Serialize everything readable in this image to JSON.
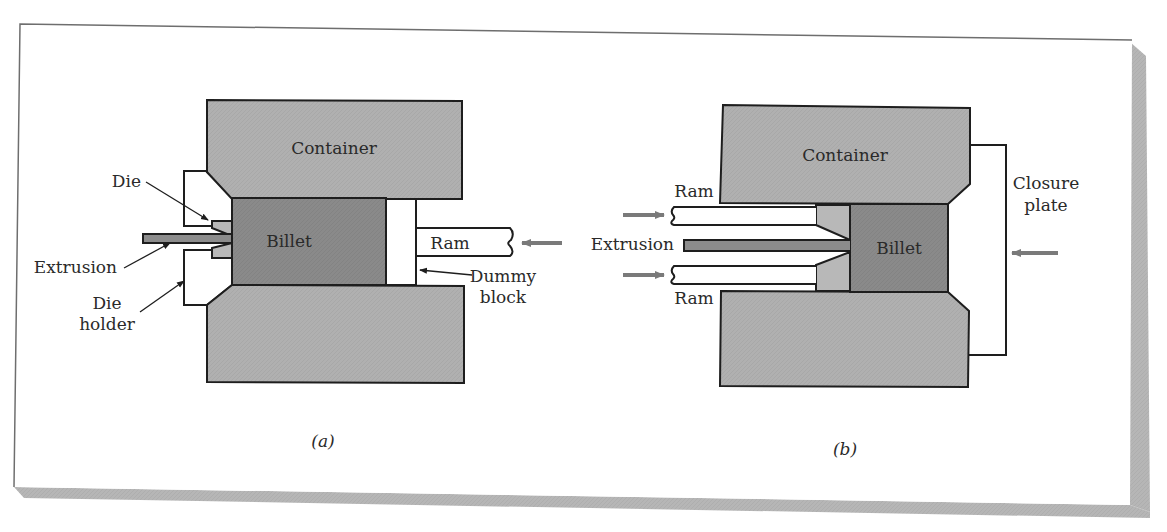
{
  "figure": {
    "panels": [
      {
        "id": "a",
        "caption": "(a)",
        "labels": {
          "container": "Container",
          "billet": "Billet",
          "ram": "Ram",
          "die": "Die",
          "extrusion": "Extrusion",
          "die_holder_line1": "Die",
          "die_holder_line2": "holder",
          "dummy_block_line1": "Dummy",
          "dummy_block_line2": "block"
        }
      },
      {
        "id": "b",
        "caption": "(b)",
        "labels": {
          "container": "Container",
          "billet": "Billet",
          "ram_top": "Ram",
          "ram_bottom": "Ram",
          "extrusion": "Extrusion",
          "closure_plate_line1": "Closure",
          "closure_plate_line2": "plate"
        }
      }
    ],
    "colors": {
      "background": "#ffffff",
      "container_fill": "#b0b0b0",
      "billet_fill": "#8a8a8a",
      "die_fill": "#b8b8b8",
      "extrusion_fill": "#8c8c8c",
      "outline": "#1e1e1e",
      "arrow": "#7a7a7a",
      "shadow": "#b4b4b4",
      "frame": "#6e6e6e"
    }
  }
}
